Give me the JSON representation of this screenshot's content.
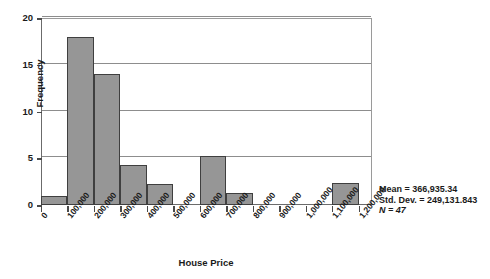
{
  "chart_data": {
    "type": "bar",
    "title": "",
    "xlabel": "House Price",
    "ylabel": "Frequency",
    "xlim": [
      0,
      1250000
    ],
    "ylim": [
      0,
      20
    ],
    "grid": true,
    "legend_position": "none",
    "bin_width": 100000,
    "categories": [
      "0-100,000",
      "100,000-200,000",
      "200,000-300,000",
      "300,000-400,000",
      "400,000-500,000",
      "500,000-600,000",
      "600,000-700,000",
      "700,000-800,000",
      "800,000-900,000",
      "900,000-1,000,000",
      "1,000,000-1,100,000",
      "1,100,000-1,200,000"
    ],
    "values": [
      1,
      18,
      14,
      4.3,
      2.2,
      0,
      5.2,
      1.3,
      0,
      0,
      0,
      2.4
    ],
    "bin_starts": [
      0,
      100000,
      200000,
      300000,
      400000,
      500000,
      600000,
      700000,
      800000,
      900000,
      1000000,
      1100000
    ],
    "x_ticks": [
      "0",
      "100,000",
      "200,000",
      "300,000",
      "400,000",
      "500,000",
      "600,000",
      "700,000",
      "800,000",
      "900,000",
      "1,000,000",
      "1,100,000",
      "1,200,000"
    ],
    "x_tick_values": [
      0,
      100000,
      200000,
      300000,
      400000,
      500000,
      600000,
      700000,
      800000,
      900000,
      1000000,
      1100000,
      1200000
    ],
    "y_ticks": [
      "0",
      "5",
      "10",
      "15",
      "20"
    ],
    "y_tick_values": [
      0,
      5,
      10,
      15,
      20
    ],
    "annotations": {
      "mean": "Mean = 366,935.34",
      "std_dev": "Std. Dev. = 249,131.843",
      "n": "N = 47"
    },
    "colors": {
      "bar_fill": "#969696",
      "bar_border": "#3f3f3f",
      "gridline": "#8d8d8d",
      "axis": "#4a4a4a",
      "text": "#1a1a1a",
      "background": "#ffffff"
    }
  }
}
